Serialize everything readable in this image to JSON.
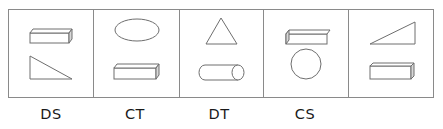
{
  "figure": {
    "panels": [
      {
        "index": 1,
        "top_shape": "cuboid-icon",
        "bottom_shape": "right-triangle-icon",
        "label": "DS"
      },
      {
        "index": 2,
        "top_shape": "ellipse-icon",
        "bottom_shape": "cuboid-icon",
        "label": "CT"
      },
      {
        "index": 3,
        "top_shape": "triangle-icon",
        "bottom_shape": "cylinder-icon",
        "label": "DT"
      },
      {
        "index": 4,
        "top_shape": "cuboid-icon",
        "bottom_shape": "circle-icon",
        "label": "CS"
      },
      {
        "index": 5,
        "top_shape": "right-triangle-icon",
        "bottom_shape": "cuboid-icon",
        "label": ""
      }
    ],
    "labels": [
      "DS",
      "CT",
      "DT",
      "CS"
    ],
    "colors": {
      "stroke": "#6e6e6e",
      "frame": "#8a8a8a",
      "text": "#1a1a1a"
    }
  }
}
